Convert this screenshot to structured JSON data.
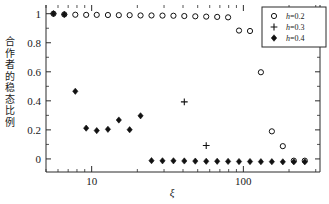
{
  "chart_data": {
    "type": "scatter",
    "title": "",
    "xlabel": "ξ",
    "ylabel": "合作者的稳态比例",
    "xscale": "log",
    "xlim": [
      5,
      320
    ],
    "ylim": [
      -0.09,
      1.06
    ],
    "grid": false,
    "legend_position": "top-right",
    "xticks_major": [
      10,
      100
    ],
    "xtick_labels": [
      "10",
      "100"
    ],
    "yticks_major": [
      0,
      0.2,
      0.4,
      0.6,
      0.8,
      1
    ],
    "ytick_labels": [
      "0",
      "0.2",
      "0.4",
      "0.6",
      "0.8",
      "1"
    ],
    "series": [
      {
        "name": "h=0.2",
        "marker": "open-circle",
        "color": "#111111",
        "x": [
          5.6,
          6.6,
          7.8,
          9.2,
          10.8,
          12.8,
          15.1,
          17.8,
          21.0,
          24.8,
          29.3,
          34.6,
          40.8,
          48.2,
          56.9,
          67.2,
          79.3,
          93.6,
          110.6,
          130.5,
          154.1,
          182.0,
          215.0,
          254.0
        ],
        "y": [
          1.0,
          0.995,
          0.993,
          0.992,
          0.992,
          0.991,
          0.99,
          0.99,
          0.988,
          0.988,
          0.987,
          0.986,
          0.984,
          0.982,
          0.98,
          0.978,
          0.975,
          0.884,
          0.881,
          0.597,
          0.19,
          0.088,
          -0.012,
          -0.012
        ]
      },
      {
        "name": "h=0.3",
        "marker": "plus",
        "color": "#111111",
        "x": [
          40.8,
          56.9
        ],
        "y": [
          0.393,
          0.092
        ]
      },
      {
        "name": "h=0.4",
        "marker": "filled-diamond",
        "color": "#111111",
        "x": [
          5.6,
          6.6,
          7.8,
          9.2,
          10.8,
          12.8,
          15.1,
          17.8,
          21.0,
          24.8,
          29.3,
          34.6,
          40.8,
          48.2,
          56.9,
          67.2,
          79.3,
          93.6,
          110.6,
          130.5,
          154.1,
          182.0,
          215.0,
          254.0
        ],
        "y": [
          1.0,
          0.995,
          0.466,
          0.212,
          0.195,
          0.204,
          0.268,
          0.201,
          0.297,
          -0.012,
          -0.013,
          -0.013,
          -0.014,
          -0.015,
          -0.016,
          -0.016,
          -0.017,
          -0.018,
          -0.018,
          -0.019,
          -0.019,
          -0.02,
          -0.02,
          -0.02
        ]
      }
    ],
    "legend": [
      {
        "label_prefix": "h",
        "label_suffix": "=0.2",
        "marker": "open-circle"
      },
      {
        "label_prefix": "h",
        "label_suffix": "=0.3",
        "marker": "plus"
      },
      {
        "label_prefix": "h",
        "label_suffix": "=0.4",
        "marker": "filled-diamond"
      }
    ]
  }
}
